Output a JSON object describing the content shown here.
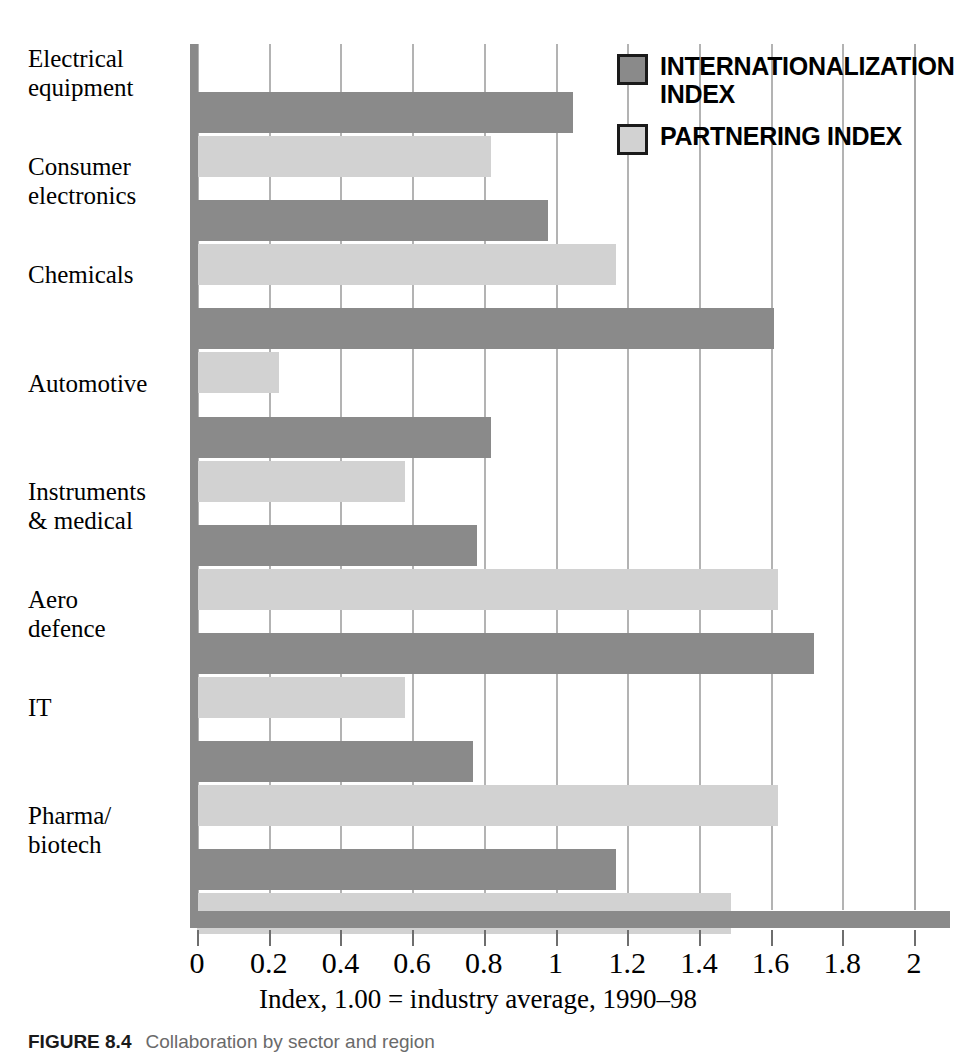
{
  "figure": {
    "caption_label": "FIGURE 8.4",
    "caption_text": "Collaboration by sector and region"
  },
  "chart_data": {
    "type": "bar",
    "orientation": "horizontal",
    "title": "",
    "subtitle": "",
    "xlabel": "Index, 1.00 = industry average, 1990–98",
    "ylabel": "",
    "xlim": [
      0,
      2
    ],
    "xticks": [
      0,
      0.2,
      0.4,
      0.6,
      0.8,
      1,
      1.2,
      1.4,
      1.6,
      1.8,
      2
    ],
    "xticklabels": [
      "0",
      "0.2",
      "0.4",
      "0.6",
      "0.8",
      "1",
      "1.2",
      "1.4",
      "1.6",
      "1.8",
      "2"
    ],
    "grid": "vertical",
    "legend_position": "top-right",
    "categories": [
      "Electrical\nequipment",
      "Consumer\nelectronics",
      "Chemicals",
      "Automotive",
      "Instruments\n& medical",
      "Aero\ndefence",
      "IT",
      "Pharma/\nbiotech"
    ],
    "series": [
      {
        "name": "INTERNATIONALIZATION\nINDEX",
        "color": "#8a8a8a",
        "values": [
          1.05,
          0.98,
          1.61,
          0.82,
          0.78,
          1.72,
          0.77,
          1.17
        ]
      },
      {
        "name": "PARTNERING INDEX",
        "color": "#d2d2d2",
        "values": [
          0.82,
          1.17,
          0.23,
          0.58,
          1.62,
          0.58,
          1.62,
          1.49
        ]
      }
    ]
  },
  "legend": {
    "items": [
      {
        "label": "INTERNATIONALIZATION\nINDEX",
        "swatch": "#8a8a8a"
      },
      {
        "label": "PARTNERING INDEX",
        "swatch": "#d2d2d2"
      }
    ]
  },
  "colors": {
    "series_dark": "#8a8a8a",
    "series_light": "#d2d2d2",
    "axis": "#8a8a8a",
    "grid": "#b3b3b3",
    "text": "#000000"
  }
}
